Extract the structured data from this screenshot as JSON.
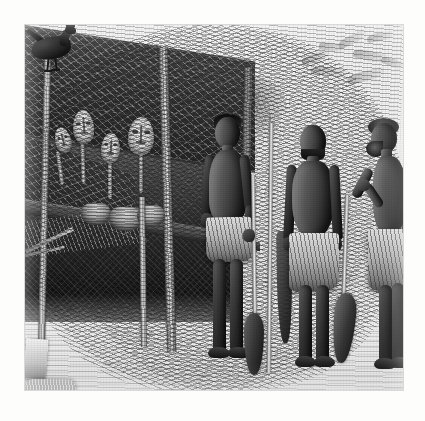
{
  "artwork": {
    "kind": "engraving",
    "title": "Three men standing before a thatched shelter hung with masks",
    "medium": "wood engraving / steel engraving reproduction",
    "palette": "monochrome grayscale",
    "plate_border_color": "#fdfdfc",
    "ink_color": "#1d1b19",
    "paper_color": "#e9e7e1",
    "caption": ""
  },
  "scene": {
    "setting_label": "open-sided thatched shelter in a village clearing",
    "time_of_day_label": "daylight",
    "ground_label": "bare sandy ground",
    "sky_label": "pale hazy sky"
  },
  "structure": {
    "roof_label": "thatched pitched roof",
    "roof_note": "cross-hatched palm thatch over diagonal rafters",
    "posts": [
      {
        "name": "corner-post-left"
      },
      {
        "name": "short-post-center"
      },
      {
        "name": "main-post-center"
      },
      {
        "name": "corner-post-right"
      }
    ],
    "braces_label": "angled roof braces"
  },
  "objects": {
    "masks": [
      {
        "name": "mask-small-left",
        "description": "small pale oval mask on handle"
      },
      {
        "name": "mask-tall-left",
        "description": "tall pale mask with elongated face"
      },
      {
        "name": "mask-center",
        "description": "pale oval mask on handle"
      },
      {
        "name": "mask-large-right",
        "description": "large round pale mask with carved features"
      }
    ],
    "baskets": [
      {
        "name": "basket-left"
      },
      {
        "name": "basket-center"
      },
      {
        "name": "basket-right"
      }
    ],
    "bundles": [
      {
        "name": "grass-skirt-bundle",
        "description": "fringed raffia skirt hanging"
      },
      {
        "name": "white-cloth",
        "description": "pale hanging cloth"
      },
      {
        "name": "goods-pile",
        "description": "heaped wares on platform"
      },
      {
        "name": "shallow-tray",
        "description": "woven tray"
      }
    ],
    "bowl": {
      "name": "wooden-bowl",
      "description": "large footed wooden bowl / mortar in shade"
    },
    "fowl": {
      "name": "black-fowl",
      "description": "black chicken pecking on the ground"
    },
    "foliage": {
      "name": "background-foliage",
      "description": "faint leafy branch upper right"
    },
    "bush": {
      "name": "background-bush",
      "description": "soft shrub behind the figures"
    }
  },
  "figures": [
    {
      "id": "figure-left",
      "label": "Young man with spear",
      "pose": "standing frontal, right hand gripping an upright spear",
      "dress": "patterned cloth wrapped at the waist",
      "holding": "spear"
    },
    {
      "id": "figure-center",
      "label": "Older man",
      "pose": "standing frontal, arms relaxed at the sides",
      "dress": "long striped cloth wrapped from waist to calf",
      "holding": "none"
    },
    {
      "id": "figure-right",
      "label": "Elder in profile",
      "pose": "standing in left profile, near arm raised with hand lifted",
      "dress": "patterned cloth wrapped at the waist",
      "holding": "none"
    }
  ],
  "implements": [
    {
      "name": "spear",
      "description": "long slender spear with small blade"
    },
    {
      "name": "paddle-left",
      "description": "canoe paddle leaning, blade at ground"
    },
    {
      "name": "paddle-center",
      "description": "dark paddle blade behind the figures"
    },
    {
      "name": "paddle-right",
      "description": "canoe paddle with broad blade at right"
    }
  ]
}
